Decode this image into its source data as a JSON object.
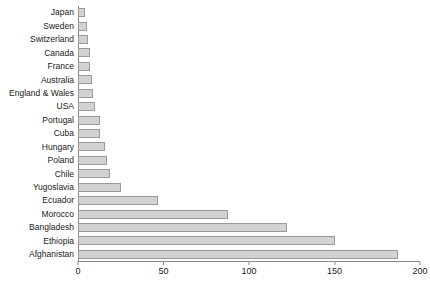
{
  "chart_data": {
    "type": "bar",
    "orientation": "horizontal",
    "title": "",
    "subtitle": "",
    "xlabel": "",
    "ylabel": "",
    "xlim": [
      0,
      200
    ],
    "ylim": null,
    "grid": false,
    "legend": null,
    "xticks": [
      0,
      50,
      100,
      150,
      200
    ],
    "xtick_labels": [
      "0",
      "50",
      "100",
      "150",
      "200"
    ],
    "categories": [
      "Japan",
      "Sweden",
      "Switzerland",
      "Canada",
      "France",
      "Australia",
      "England & Wales",
      "USA",
      "Portugal",
      "Cuba",
      "Hungary",
      "Poland",
      "Chile",
      "Yugoslavia",
      "Ecuador",
      "Morocco",
      "Bangladesh",
      "Ethiopia",
      "Afghanistan"
    ],
    "values": [
      4,
      5,
      6,
      7,
      7,
      8,
      9,
      10,
      13,
      13,
      16,
      17,
      19,
      25,
      47,
      88,
      122,
      150,
      187
    ],
    "bar_color": "#d2d2d2",
    "bar_edge_color": "#9a9a9a",
    "axis_color": "#8a8a8a",
    "text_color": "#1a1a1a"
  }
}
